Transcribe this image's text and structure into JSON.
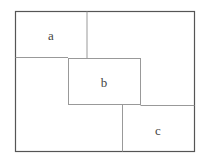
{
  "diagram": {
    "outer": {
      "x": 15,
      "y": 11,
      "w": 179,
      "h": 140
    },
    "line_color": "#999999",
    "border_color": "#555555",
    "regions": [
      {
        "label": "a",
        "cx": 51,
        "cy": 35
      },
      {
        "label": "b",
        "cx": 104,
        "cy": 82
      },
      {
        "label": "c",
        "cx": 158,
        "cy": 130
      }
    ]
  }
}
